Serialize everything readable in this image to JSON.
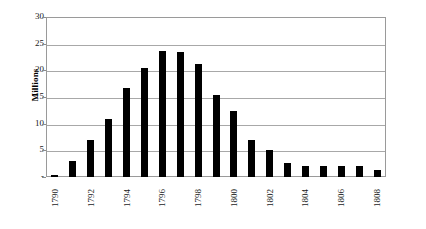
{
  "chart_data": {
    "type": "bar",
    "title": "",
    "xlabel": "",
    "ylabel": "Millions",
    "ylim": [
      0,
      30
    ],
    "grid": true,
    "legend": false,
    "y_ticks": [
      "30",
      "25",
      "20",
      "15",
      "10",
      "5",
      "-"
    ],
    "y_tick_values": [
      30,
      25,
      20,
      15,
      10,
      5,
      0
    ],
    "categories": [
      "1790",
      "1791",
      "1792",
      "1793",
      "1794",
      "1795",
      "1796",
      "1797",
      "1798",
      "1799",
      "1800",
      "1801",
      "1802",
      "1803",
      "1804",
      "1805",
      "1806",
      "1807",
      "1808"
    ],
    "visible_x_tick_labels": [
      "1790",
      "1792",
      "1794",
      "1796",
      "1798",
      "1800",
      "1802",
      "1804",
      "1806",
      "1808"
    ],
    "values": [
      0.3,
      3.0,
      7.0,
      10.8,
      16.7,
      20.5,
      23.7,
      23.4,
      21.2,
      15.3,
      12.4,
      7.0,
      5.0,
      2.7,
      2.0,
      2.0,
      2.0,
      2.0,
      1.3
    ],
    "bar_color": "#000000",
    "grid_color": "#a8a8a8",
    "frame_color": "#9a9a9a",
    "background": "#ffffff"
  }
}
